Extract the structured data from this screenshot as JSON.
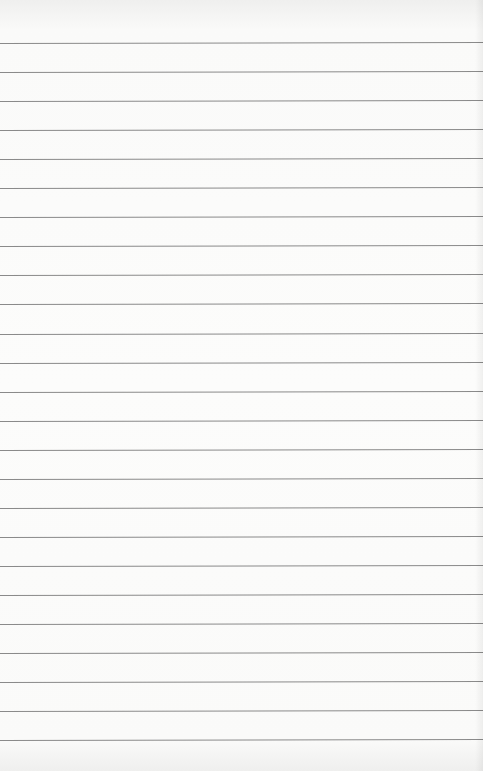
{
  "paper": {
    "type": "lined-paper",
    "background_color": "#fafaf9",
    "rule_color": "#8a8a8a",
    "rule_count": 25,
    "first_rule_y": 43,
    "rule_spacing": 29.05
  }
}
